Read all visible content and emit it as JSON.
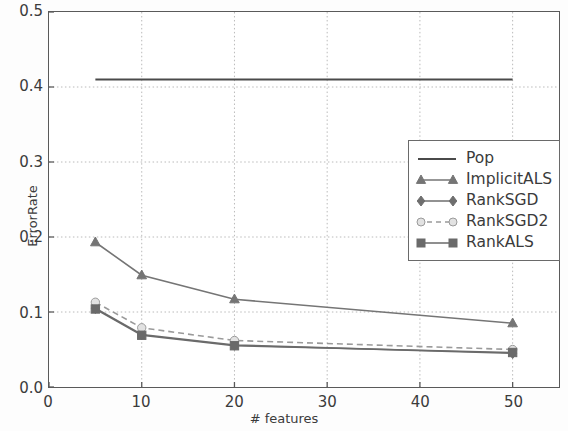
{
  "chart_data": {
    "type": "line",
    "title": "",
    "xlabel": "# features",
    "ylabel": "ErrorRate",
    "xlim": [
      0,
      55
    ],
    "ylim": [
      0.0,
      0.5
    ],
    "x": [
      5,
      10,
      20,
      50
    ],
    "xticks": [
      "0",
      "10",
      "20",
      "30",
      "40",
      "50"
    ],
    "xtick_values": [
      0,
      10,
      20,
      30,
      40,
      50
    ],
    "yticks": [
      "0.0",
      "0.1",
      "0.2",
      "0.3",
      "0.4",
      "0.5"
    ],
    "ytick_values": [
      0.0,
      0.1,
      0.2,
      0.3,
      0.4,
      0.5
    ],
    "grid": true,
    "legend_position": "upper right",
    "series": [
      {
        "name": "Pop",
        "values": [
          0.41,
          0.41,
          0.41,
          0.41
        ],
        "marker": "none",
        "linestyle": "solid",
        "color": "#4a4a4a"
      },
      {
        "name": "ImplicitALS",
        "values": [
          0.193,
          0.149,
          0.117,
          0.085
        ],
        "marker": "triangle",
        "linestyle": "solid",
        "color": "#757575"
      },
      {
        "name": "RankSGD",
        "values": [
          0.105,
          0.07,
          0.056,
          0.045
        ],
        "marker": "diamond",
        "linestyle": "solid",
        "color": "#6e6e6e"
      },
      {
        "name": "RankSGD2",
        "values": [
          0.113,
          0.079,
          0.062,
          0.05
        ],
        "marker": "circle",
        "linestyle": "dashed",
        "color": "#9a9a9a"
      },
      {
        "name": "RankALS",
        "values": [
          0.104,
          0.069,
          0.055,
          0.046
        ],
        "marker": "square",
        "linestyle": "solid",
        "color": "#6a6a6a"
      }
    ]
  },
  "legend": {
    "entries": [
      {
        "label": "Pop"
      },
      {
        "label": "ImplicitALS"
      },
      {
        "label": "RankSGD"
      },
      {
        "label": "RankSGD2"
      },
      {
        "label": "RankALS"
      }
    ]
  }
}
